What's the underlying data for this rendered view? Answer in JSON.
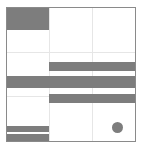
{
  "board": {
    "rows": 3,
    "cols": 3,
    "border_color": "#8a8a8a",
    "grid_color": "#e6e6e6",
    "piece_color": "#7d7d7d"
  },
  "pieces": [
    {
      "name": "top-left-block",
      "x": 0,
      "y": 0,
      "w": 43,
      "h": 22
    },
    {
      "name": "bar-1",
      "x": 43,
      "y": 54,
      "w": 87,
      "h": 9
    },
    {
      "name": "bar-2",
      "x": 0,
      "y": 68,
      "w": 130,
      "h": 12
    },
    {
      "name": "bar-3",
      "x": 43,
      "y": 86,
      "w": 87,
      "h": 9
    },
    {
      "name": "bottom-bar-1",
      "x": 0,
      "y": 118,
      "w": 43,
      "h": 6
    },
    {
      "name": "bottom-bar-2",
      "x": 0,
      "y": 126,
      "w": 43,
      "h": 7
    }
  ],
  "dot": {
    "cx": 111,
    "cy": 120,
    "r": 5
  }
}
